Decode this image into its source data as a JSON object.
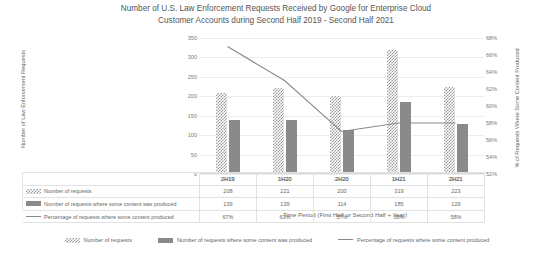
{
  "chart_data": {
    "type": "bar",
    "title": "Number of U.S. Law Enforcement Requests Received by Google for Enterprise Cloud Customer Accounts during Second Half 2019 - Second Half 2021",
    "title_line1": "Number of U.S. Law Enforcement Requests Received by Google for Enterprise Cloud",
    "title_line2": "Customer Accounts during Second Half 2019 - Second Half 2021",
    "xlabel": "Time Period (First Half or Second Half + Year)",
    "ylabel": "Number of Law Enforcement Requests",
    "y2label": "% of Requests Where Some Content Produced",
    "categories": [
      "2H19",
      "1H20",
      "2H20",
      "1H21",
      "2H21"
    ],
    "ylim": [
      0,
      350
    ],
    "yticks": [
      "0",
      "50",
      "100",
      "150",
      "200",
      "250",
      "300",
      "350"
    ],
    "ytick_values": [
      0,
      50,
      100,
      150,
      200,
      250,
      300,
      350
    ],
    "y2lim": [
      52,
      68
    ],
    "y2ticks": [
      "52%",
      "54%",
      "56%",
      "58%",
      "60%",
      "62%",
      "64%",
      "66%",
      "68%"
    ],
    "y2tick_values": [
      52,
      54,
      56,
      58,
      60,
      62,
      64,
      66,
      68
    ],
    "grid": true,
    "legend_position": "bottom",
    "series": [
      {
        "name": "Number of requests",
        "type": "bar",
        "axis": "left",
        "marker": "pattern-checkered",
        "color": "#9a9a9a",
        "values": [
          208,
          221,
          200,
          319,
          223
        ]
      },
      {
        "name": "Number of requests where some content was produced",
        "type": "bar",
        "axis": "left",
        "marker": "solid",
        "color": "#8a8a8a",
        "values": [
          139,
          139,
          114,
          185,
          129
        ]
      },
      {
        "name": "Percentage of requests where some content produced",
        "type": "line",
        "axis": "right",
        "marker": "line",
        "color": "#8a8a8a",
        "values": [
          67,
          63,
          57,
          58,
          58
        ],
        "value_labels": [
          "67%",
          "63%",
          "57%",
          "58%",
          "58%"
        ]
      }
    ],
    "data_table": {
      "header": [
        "",
        "2H19",
        "1H20",
        "2H20",
        "1H21",
        "2H21"
      ],
      "rows": [
        {
          "label": "Number of requests",
          "marker": "pattern-checkered",
          "values": [
            "208",
            "221",
            "200",
            "319",
            "223"
          ]
        },
        {
          "label": "Number of requests where some content was produced",
          "marker": "solid",
          "values": [
            "139",
            "139",
            "114",
            "185",
            "129"
          ]
        },
        {
          "label": "Percentage of requests where some content produced",
          "marker": "line",
          "values": [
            "67%",
            "63%",
            "57%",
            "58%",
            "58%"
          ]
        }
      ]
    },
    "legend": [
      {
        "label": "Number of requests",
        "marker": "pattern-checkered"
      },
      {
        "label": "Number of requests where some content was produced",
        "marker": "solid"
      },
      {
        "label": "Percentage of requests where some content produced",
        "marker": "line"
      }
    ]
  }
}
